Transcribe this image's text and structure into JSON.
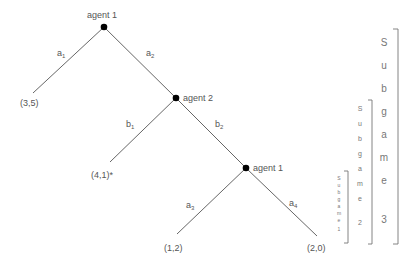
{
  "diagram": {
    "type": "game-tree",
    "nodes": [
      {
        "id": "root",
        "label": "agent 1",
        "x": 104,
        "y": 27
      },
      {
        "id": "n2",
        "label": "agent 2",
        "x": 176,
        "y": 98
      },
      {
        "id": "n3",
        "label": "agent 1",
        "x": 246,
        "y": 168
      }
    ],
    "edges": [
      {
        "from": "root",
        "to": "leaf_3_5",
        "label_main": "a",
        "label_sub": "1"
      },
      {
        "from": "root",
        "to": "n2",
        "label_main": "a",
        "label_sub": "2"
      },
      {
        "from": "n2",
        "to": "leaf_4_1",
        "label_main": "b",
        "label_sub": "1"
      },
      {
        "from": "n2",
        "to": "n3",
        "label_main": "b",
        "label_sub": "2"
      },
      {
        "from": "n3",
        "to": "leaf_1_2",
        "label_main": "a",
        "label_sub": "3"
      },
      {
        "from": "n3",
        "to": "leaf_2_0",
        "label_main": "a",
        "label_sub": "4"
      }
    ],
    "leaves": [
      {
        "id": "leaf_3_5",
        "payoff": "(3,5)"
      },
      {
        "id": "leaf_4_1",
        "payoff": "(4,1)*"
      },
      {
        "id": "leaf_1_2",
        "payoff": "(1,2)"
      },
      {
        "id": "leaf_2_0",
        "payoff": "(2,0)"
      }
    ],
    "subgames": [
      {
        "id": "subgame-1",
        "letters": [
          "S",
          "u",
          "b",
          "g",
          "a",
          "m",
          "e"
        ],
        "number": "1"
      },
      {
        "id": "subgame-2",
        "letters": [
          "S",
          "u",
          "b",
          "g",
          "a",
          "m",
          "e"
        ],
        "number": "2"
      },
      {
        "id": "subgame-3",
        "letters": [
          "S",
          "u",
          "b",
          "g",
          "a",
          "m",
          "e"
        ],
        "number": "3"
      }
    ],
    "colors": {
      "line": "#555555",
      "node": "#000000",
      "text": "#555555",
      "bracket": "#777777"
    }
  }
}
